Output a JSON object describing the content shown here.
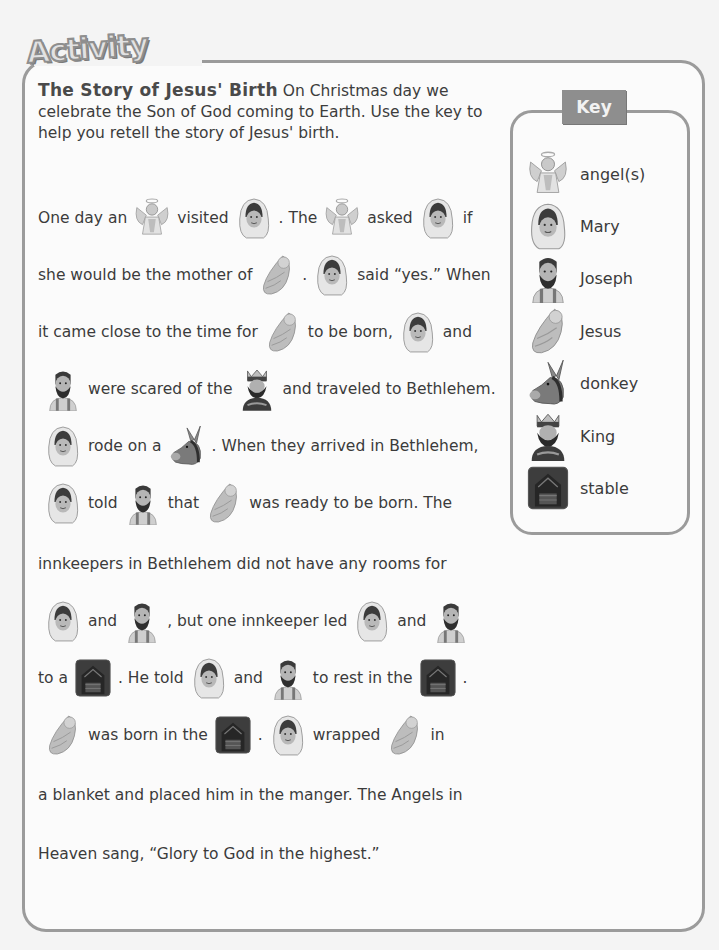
{
  "banner": {
    "label": "Activity"
  },
  "intro": {
    "heading": "The Story of Jesus' Birth",
    "text": "On Christmas day we celebrate the Son of God coming to Earth. Use the key to help you retell the story of Jesus' birth."
  },
  "key": {
    "label": "Key",
    "items": [
      {
        "icon": "angel-icon",
        "name": "angel(s)"
      },
      {
        "icon": "mary-icon",
        "name": "Mary"
      },
      {
        "icon": "joseph-icon",
        "name": "Joseph"
      },
      {
        "icon": "jesus-icon",
        "name": "Jesus"
      },
      {
        "icon": "donkey-icon",
        "name": "donkey"
      },
      {
        "icon": "king-icon",
        "name": "King"
      },
      {
        "icon": "stable-icon",
        "name": "stable"
      }
    ]
  },
  "story": {
    "lines": [
      [
        "One day an",
        "@angel",
        "visited",
        "@mary",
        ". The",
        "@angel",
        "asked",
        "@mary",
        "if"
      ],
      [
        "she would be the mother of",
        "@jesus",
        ".",
        "@mary",
        "said “yes.” When"
      ],
      [
        "it came close to the time for",
        "@jesus",
        "to be born,",
        "@mary",
        "and"
      ],
      [
        "@joseph",
        "were scared of the",
        "@king",
        "and traveled to Bethlehem."
      ],
      [
        "@mary",
        "rode on a",
        "@donkey",
        ". When they arrived in Bethlehem,"
      ],
      [
        "@mary",
        "told",
        "@joseph",
        "that",
        "@jesus",
        "was ready to be born. The"
      ],
      [
        "innkeepers in Bethlehem did not have any rooms for"
      ],
      [
        "@mary",
        "and",
        "@joseph",
        ", but one innkeeper led",
        "@mary",
        "and",
        "@joseph"
      ],
      [
        "to a",
        "@stable",
        ". He told",
        "@mary",
        "and",
        "@joseph",
        "to rest in the",
        "@stable",
        "."
      ],
      [
        "@jesus",
        "was born in the",
        "@stable",
        ".",
        "@mary",
        "wrapped",
        "@jesus",
        "in"
      ],
      [
        "a blanket and placed him in the manger. The Angels in"
      ],
      [
        "Heaven sang, “Glory to God in the highest.”"
      ]
    ]
  },
  "colors": {
    "frame": "#9b9b9b",
    "key_tab": "#8e8e8e",
    "text": "#3b3b3b",
    "background": "#f4f4f4"
  }
}
